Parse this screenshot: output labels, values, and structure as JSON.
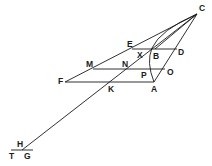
{
  "diagram": {
    "type": "geometric-construction",
    "points": {
      "C": {
        "label": "C",
        "x": 197,
        "y": 14
      },
      "E": {
        "label": "E",
        "x": 132,
        "y": 49
      },
      "X": {
        "label": "X",
        "x": 144,
        "y": 49
      },
      "B": {
        "label": "B",
        "x": 155,
        "y": 49
      },
      "D": {
        "label": "D",
        "x": 177,
        "y": 49
      },
      "M": {
        "label": "M",
        "x": 93,
        "y": 69
      },
      "N": {
        "label": "N",
        "x": 126,
        "y": 69
      },
      "P": {
        "label": "P",
        "x": 150,
        "y": 69
      },
      "O": {
        "label": "O",
        "x": 165,
        "y": 69
      },
      "F": {
        "label": "F",
        "x": 65,
        "y": 82
      },
      "K": {
        "label": "K",
        "x": 111,
        "y": 82
      },
      "A": {
        "label": "A",
        "x": 154,
        "y": 82
      },
      "H": {
        "label": "H",
        "x": 22,
        "y": 150
      },
      "T": {
        "label": "T",
        "x": 13,
        "y": 150
      },
      "G": {
        "label": "G",
        "x": 29,
        "y": 150
      }
    },
    "labels": [
      "C",
      "E",
      "X",
      "B",
      "D",
      "M",
      "N",
      "P",
      "O",
      "F",
      "K",
      "A",
      "H",
      "T",
      "G"
    ],
    "segments": [
      [
        "F",
        "C"
      ],
      [
        "C",
        "A"
      ],
      [
        "E",
        "D"
      ],
      [
        "M",
        "O"
      ],
      [
        "F",
        "A"
      ],
      [
        "H",
        "C"
      ],
      [
        "T",
        "G"
      ],
      [
        "C",
        "B"
      ]
    ],
    "curves": [
      {
        "name": "arc-BA",
        "from": "C",
        "through": "B",
        "to": "A"
      }
    ],
    "stroke_color": "#1a1a1a",
    "background": "#ffffff"
  }
}
